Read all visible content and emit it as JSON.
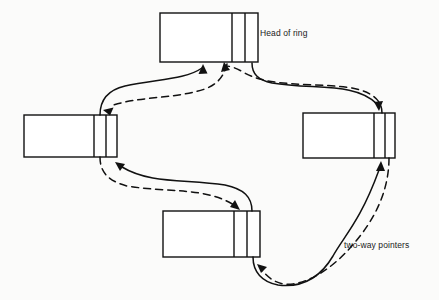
{
  "diagram": {
    "background_color": "#fbfbfa",
    "line_color": "#111111",
    "node_fill": "#ffffff",
    "labels": {
      "head_of_ring": "Head of ring",
      "two_way_pointers": "two-way pointers"
    },
    "nodes": [
      {
        "id": "head",
        "name": "head-node",
        "position": "top",
        "x": 160,
        "y": 13,
        "width": 98,
        "height": 49,
        "dividers": [
          232,
          245
        ],
        "cells": 3
      },
      {
        "id": "left",
        "name": "left-node",
        "position": "left",
        "x": 24,
        "y": 115,
        "width": 93,
        "height": 42,
        "dividers": [
          94,
          106
        ],
        "cells": 3
      },
      {
        "id": "right",
        "name": "right-node",
        "position": "right",
        "x": 303,
        "y": 113,
        "width": 92,
        "height": 45,
        "dividers": [
          374,
          385
        ],
        "cells": 3
      },
      {
        "id": "bottom",
        "name": "bottom-node",
        "position": "bottom",
        "x": 163,
        "y": 211,
        "width": 97,
        "height": 46,
        "dividers": [
          234,
          247
        ],
        "cells": 3
      }
    ],
    "links": [
      {
        "id": "left-to-head",
        "style": "solid",
        "from": "left",
        "to": "head",
        "arrow": "head"
      },
      {
        "id": "head-to-left",
        "style": "dashed",
        "from": "head",
        "to": "left",
        "arrow": "left"
      },
      {
        "id": "head-to-right",
        "style": "solid",
        "from": "head",
        "to": "right",
        "arrow": "right"
      },
      {
        "id": "right-to-head",
        "style": "dashed",
        "from": "right",
        "to": "head",
        "arrow": "head"
      },
      {
        "id": "bottom-to-left",
        "style": "solid",
        "from": "bottom",
        "to": "left",
        "arrow": "left"
      },
      {
        "id": "left-to-bottom",
        "style": "dashed",
        "from": "left",
        "to": "bottom",
        "arrow": "bottom"
      },
      {
        "id": "bottom-to-right",
        "style": "solid",
        "from": "bottom",
        "to": "right",
        "arrow": "right"
      },
      {
        "id": "right-to-bottom",
        "style": "dashed",
        "from": "right",
        "to": "bottom",
        "arrow": "bottom"
      }
    ]
  }
}
